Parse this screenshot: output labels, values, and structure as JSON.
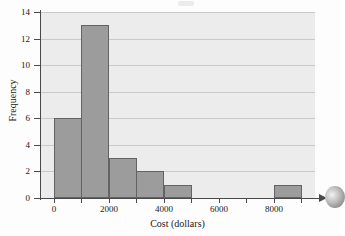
{
  "chart_data": {
    "type": "bar",
    "title": "",
    "subtitle": "",
    "xlabel": "Cost (dollars)",
    "ylabel": "Frequency",
    "xlim": [
      -500,
      9500
    ],
    "ylim": [
      0,
      14
    ],
    "grid": "horizontal",
    "legend": "none",
    "bin_width": 1000,
    "categories": [
      "0-1000",
      "1000-2000",
      "2000-3000",
      "3000-4000",
      "4000-5000",
      "5000-6000",
      "6000-7000",
      "7000-8000",
      "8000-9000"
    ],
    "bin_starts": [
      0,
      1000,
      2000,
      3000,
      4000,
      5000,
      6000,
      7000,
      8000
    ],
    "values": [
      6,
      13,
      3,
      2,
      1,
      0,
      0,
      0,
      1
    ],
    "x_tick_values": [
      0,
      1000,
      2000,
      3000,
      4000,
      5000,
      6000,
      7000,
      8000,
      9000
    ],
    "x_tick_labels": [
      "0",
      "",
      "2000",
      "",
      "4000",
      "",
      "6000",
      "",
      "8000",
      ""
    ],
    "y_tick_values": [
      0,
      2,
      4,
      6,
      8,
      10,
      12,
      14
    ],
    "y_tick_labels": [
      "0",
      "2",
      "4",
      "6",
      "8",
      "10",
      "12",
      "14"
    ],
    "colors": {
      "bar_fill": "#9c9c9c",
      "bar_edge": "#636363",
      "plot_background": "#ececec",
      "gridline": "#c9c9c9",
      "axis": "#4a4a4a",
      "text": "#1a1a1a"
    }
  },
  "figure": {
    "x_axis_arrow": "arrow-right",
    "artifacts": [
      "scan-smudge-top",
      "scan-smudge-right"
    ]
  }
}
